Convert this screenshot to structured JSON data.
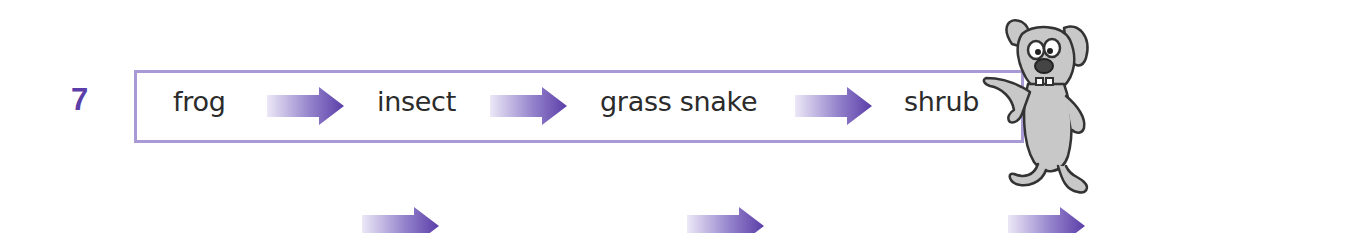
{
  "question": {
    "number": "7",
    "number_color": "#5b3ea8"
  },
  "food_chain": {
    "items": [
      {
        "label": "frog"
      },
      {
        "label": "insect"
      },
      {
        "label": "grass snake"
      },
      {
        "label": "shrub"
      }
    ],
    "box_border_color": "#a99ad6",
    "arrow_gradient": [
      "#e6e1f4",
      "#5b3ea8"
    ]
  },
  "answer_row": {
    "blank_slots": 4,
    "arrows": 3
  },
  "decoration": {
    "mascot": "cartoon-dog-leaning-icon"
  }
}
